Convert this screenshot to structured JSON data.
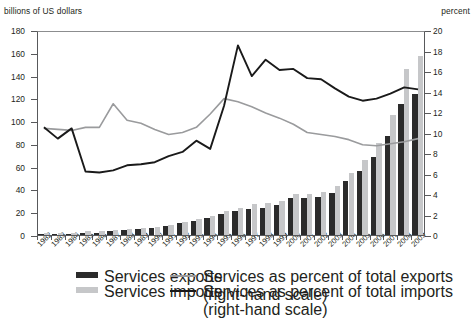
{
  "axis_titles": {
    "left": "billions of US dollars",
    "right": "percent"
  },
  "legend": {
    "exports_bar": "Services exports",
    "imports_bar": "Services imports",
    "exports_pct_line": "Services as percent of total exports (right-hand scale)",
    "imports_pct_line": "Services as percent of total imports (right-hand scale)"
  },
  "colors": {
    "exports_bar": "#2b2b2b",
    "imports_bar": "#c6c7c9",
    "exports_pct_line": "#9a9b9d",
    "imports_pct_line": "#1a1a1a",
    "axis": "#58595b"
  },
  "chart_data": {
    "type": "bar",
    "title": "",
    "xlabel": "",
    "ylabel": "billions of US dollars",
    "ylabel_right": "percent",
    "grid": false,
    "legend_position": "bottom",
    "ylim": [
      0,
      180
    ],
    "yticks": [
      0,
      20,
      40,
      60,
      80,
      100,
      120,
      140,
      160,
      180
    ],
    "ylim_right": [
      0,
      20
    ],
    "yticks_right": [
      0,
      2,
      4,
      6,
      8,
      10,
      12,
      14,
      16,
      18,
      20
    ],
    "categories": [
      "1982",
      "1983",
      "1984",
      "1985",
      "1986",
      "1987",
      "1988",
      "1989",
      "1990",
      "1991",
      "1992",
      "1993",
      "1994",
      "1995",
      "1996",
      "1997",
      "1998",
      "1999",
      "2000",
      "2001",
      "2002",
      "2003",
      "2004",
      "2005",
      "2006",
      "2007",
      "2008",
      "2009"
    ],
    "series": [
      {
        "name": "Services exports",
        "type": "bar",
        "axis": "left",
        "unit": "billions of US dollars",
        "values": [
          2,
          2,
          2,
          3,
          3,
          4,
          5,
          6,
          7,
          9,
          11,
          13,
          16,
          19,
          22,
          24,
          25,
          27,
          33,
          33,
          34,
          38,
          48,
          57,
          69,
          88,
          116,
          125
        ]
      },
      {
        "name": "Services imports",
        "type": "bar",
        "axis": "left",
        "unit": "billions of US dollars",
        "values": [
          3,
          3,
          3,
          4,
          4,
          5,
          6,
          7,
          8,
          10,
          12,
          15,
          18,
          22,
          25,
          28,
          29,
          31,
          37,
          37,
          39,
          44,
          55,
          67,
          82,
          106,
          147,
          158
        ]
      },
      {
        "name": "Services as percent of total exports (right-hand scale)",
        "type": "line",
        "axis": "right",
        "unit": "percent",
        "values": [
          10.5,
          10.4,
          10.3,
          10.6,
          10.6,
          12.9,
          11.3,
          11.0,
          10.4,
          9.9,
          10.1,
          10.6,
          11.9,
          13.4,
          13.1,
          12.6,
          12.0,
          11.5,
          10.9,
          10.1,
          9.9,
          9.7,
          9.4,
          8.9,
          8.8,
          9.0,
          9.2,
          9.5
        ]
      },
      {
        "name": "Services as percent of total imports (right-hand scale)",
        "type": "line",
        "axis": "right",
        "unit": "percent",
        "values": [
          10.6,
          9.5,
          10.5,
          6.3,
          6.2,
          6.4,
          6.9,
          7.0,
          7.2,
          7.8,
          8.2,
          9.3,
          8.5,
          12.7,
          18.6,
          15.6,
          17.2,
          16.2,
          16.3,
          15.4,
          15.3,
          14.4,
          13.6,
          13.2,
          13.4,
          13.9,
          14.5,
          14.3
        ]
      }
    ]
  }
}
